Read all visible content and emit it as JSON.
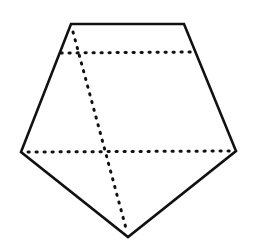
{
  "diagram": {
    "type": "geometry",
    "stroke_color": "#111111",
    "background": "#ffffff",
    "pentagon": {
      "vertices": [
        [
          71,
          24
        ],
        [
          184,
          24
        ],
        [
          236,
          151
        ],
        [
          128,
          237
        ],
        [
          21,
          152
        ]
      ],
      "stroke_width": 2.6
    },
    "dotted_lines": [
      {
        "name": "upper-horizontal-chord",
        "from": [
          61,
          53
        ],
        "to": [
          195,
          52
        ]
      },
      {
        "name": "lower-horizontal-chord",
        "from": [
          28,
          152
        ],
        "to": [
          230,
          151
        ]
      },
      {
        "name": "slanted-line",
        "from": [
          73,
          32
        ],
        "to": [
          127,
          232
        ]
      }
    ],
    "dot_pattern": {
      "dash": 1.2,
      "gap": 6.8,
      "width": 3
    }
  }
}
